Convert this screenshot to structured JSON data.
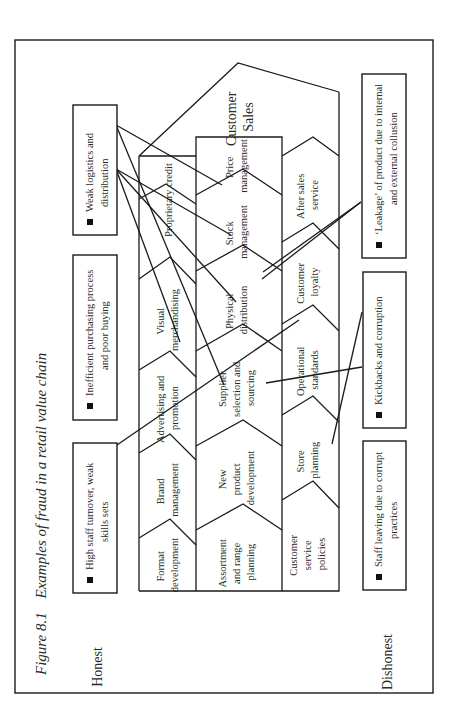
{
  "figure": {
    "number": "Figure 8.1",
    "title": "Examples of fraud in a retail value chain"
  },
  "axis_labels": {
    "top": "Honest",
    "bottom": "Dishonest"
  },
  "value_chain": {
    "end_label": [
      "Customer",
      "Sales"
    ],
    "rows": [
      {
        "name": "row-1",
        "cells": [
          [
            "Format",
            "development"
          ],
          [
            "Brand",
            "management"
          ],
          [
            "Advertising and",
            "promotion"
          ],
          [
            "Visual",
            "merchandising"
          ],
          [
            "Proprietary credit"
          ]
        ]
      },
      {
        "name": "row-2",
        "cells": [
          [
            "Assortment",
            "and range",
            "planning"
          ],
          [
            "New",
            "product",
            "development"
          ],
          [
            "Supplier",
            "selection and",
            "sourcing"
          ],
          [
            "Physical",
            "distribution"
          ],
          [
            "Stock",
            "management"
          ],
          [
            "Price",
            "management"
          ]
        ]
      },
      {
        "name": "row-3",
        "cells": [
          [
            "Customer",
            "service",
            "policies"
          ],
          [
            "Store",
            "planning"
          ],
          [
            "Operational",
            "standards"
          ],
          [
            "Customer",
            "loyalty"
          ],
          [
            "After sales",
            "service"
          ]
        ]
      }
    ]
  },
  "honest_issues": [
    {
      "bullet": "■",
      "lines": [
        "High staff turnover, weak",
        "skills sets"
      ]
    },
    {
      "bullet": "■",
      "lines": [
        "Inefficient purchasing process",
        "and poor buying"
      ]
    },
    {
      "bullet": "■",
      "lines": [
        "Weak logistics and",
        "distribution"
      ]
    }
  ],
  "dishonest_issues": [
    {
      "bullet": "■",
      "lines": [
        "Staff leaving due to corrupt",
        "practices"
      ]
    },
    {
      "bullet": "■",
      "lines": [
        "Kickbacks and corruption"
      ]
    },
    {
      "bullet": "■",
      "lines": [
        "‘Leakage’ of product due to internal",
        "and external collusion"
      ]
    }
  ]
}
